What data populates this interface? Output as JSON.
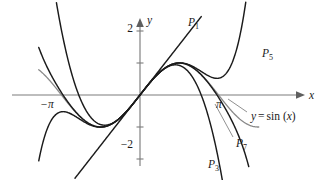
{
  "figure": {
    "kind": "math-plot",
    "background_color": "#ffffff",
    "curve_color": "#1b1b1b",
    "sin_curve_color": "#8a8a8a",
    "axis_color": "#7d7d7d"
  },
  "axes": {
    "x_label": "x",
    "y_label": "y",
    "x_range": [
      -4.05,
      4.75
    ],
    "y_range": [
      -2.85,
      2.6
    ],
    "x_tick_labels": [
      {
        "text": "−π",
        "value": -3.14159
      },
      {
        "text": "π",
        "value": 3.14159
      }
    ],
    "y_tick_labels": [
      {
        "text": "2",
        "value": 2
      },
      {
        "text": "−2",
        "value": -2
      }
    ],
    "y_tick_values": [
      2,
      1,
      -1,
      -2
    ],
    "arrow_x": true,
    "arrow_y": true,
    "grid": false
  },
  "annotations": {
    "sin_label": {
      "prefix": "y",
      "equals": "=",
      "body": "sin (",
      "var": "x",
      "close": ")",
      "full": "y = sin (x)"
    },
    "p1": "P",
    "p1_sub": "1",
    "p3": "P",
    "p3_sub": "3",
    "p5": "P",
    "p5_sub": "5",
    "p7": "P",
    "p7_sub": "7"
  },
  "chart_data": {
    "type": "line",
    "xlabel": "x",
    "ylabel": "y",
    "xlim": [
      -4.05,
      4.75
    ],
    "ylim": [
      -2.85,
      2.6
    ],
    "grid": false,
    "legend": "inline curve labels",
    "x_ticks": [
      -3.14159,
      3.14159
    ],
    "x_tick_labels": [
      "−π",
      "π"
    ],
    "y_ticks": [
      -2,
      -1,
      1,
      2
    ],
    "y_tick_labels": [
      "−2",
      "",
      "",
      "2"
    ],
    "series": [
      {
        "name": "y = sin (x)",
        "label": "y = sin (x)",
        "color": "#8a8a8a",
        "kind": "sine",
        "expression": "sin(x)",
        "domain": [
          -4.05,
          4.75
        ]
      },
      {
        "name": "P1",
        "label": "P₁",
        "color": "#1b1b1b",
        "kind": "taylor",
        "degree": 1,
        "coefficients": [
          0,
          1
        ],
        "expression": "x",
        "domain": [
          -2.6,
          2.45
        ]
      },
      {
        "name": "P3",
        "label": "P₃",
        "color": "#1b1b1b",
        "kind": "taylor",
        "degree": 3,
        "coefficients": [
          0,
          1,
          0,
          -0.1666667
        ],
        "expression": "x - x^3/6",
        "domain": [
          -4.05,
          4.2
        ]
      },
      {
        "name": "P5",
        "label": "P₅",
        "color": "#1b1b1b",
        "kind": "taylor",
        "degree": 5,
        "coefficients": [
          0,
          1,
          0,
          -0.1666667,
          0,
          0.0083333
        ],
        "expression": "x - x^3/6 + x^5/120",
        "domain": [
          -4.05,
          4.6
        ]
      },
      {
        "name": "P7",
        "label": "P₇",
        "color": "#1b1b1b",
        "kind": "taylor",
        "degree": 7,
        "coefficients": [
          0,
          1,
          0,
          -0.1666667,
          0,
          0.0083333,
          0,
          -0.0001984127
        ],
        "expression": "x - x^3/6 + x^5/120 - x^7/5040",
        "domain": [
          -4.05,
          4.35
        ]
      }
    ],
    "labels": [
      {
        "text": "P1",
        "x": 2.45,
        "y": 2.25
      },
      {
        "text": "P5",
        "x": 4.2,
        "y": 1.35
      },
      {
        "text": "P3",
        "x": 3.1,
        "y": -2.55
      },
      {
        "text": "P7",
        "x": 3.75,
        "y": -2.1
      },
      {
        "text": "y = sin (x)",
        "x": 4.1,
        "y": -0.75
      }
    ]
  }
}
